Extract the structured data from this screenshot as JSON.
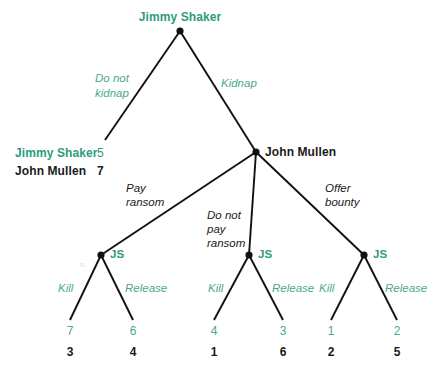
{
  "diagram": {
    "colors": {
      "player1_green": "#2e9b7e",
      "action_green": "#4aa98d",
      "player2_black": "#1a1a1a",
      "edge": "#111111",
      "background": "#ffffff"
    },
    "root": {
      "player_label": "Jimmy Shaker",
      "actions": [
        {
          "label_line1": "Do not",
          "label_line2": "kidnap",
          "style": "green"
        },
        {
          "label_line1": "Kidnap",
          "label_line2": "",
          "style": "green"
        }
      ]
    },
    "terminal_left": {
      "row1_name": "Jimmy Shaker",
      "row1_value": "5",
      "row2_name": "John Mullen",
      "row2_value": "7"
    },
    "second_node": {
      "player_label": "John Mullen",
      "actions": [
        {
          "label_line1": "Pay",
          "label_line2": "ransom",
          "label_line3": "",
          "style": "black"
        },
        {
          "label_line1": "Do not",
          "label_line2": "pay",
          "label_line3": "ransom",
          "style": "black"
        },
        {
          "label_line1": "Offer",
          "label_line2": "bounty",
          "label_line3": "",
          "style": "black"
        }
      ]
    },
    "js_nodes": [
      {
        "label": "JS",
        "left_action": "Kill",
        "right_action": "Release"
      },
      {
        "label": "JS",
        "left_action": "Kill",
        "right_action": "Release"
      },
      {
        "label": "JS",
        "left_action": "Kill",
        "right_action": "Release"
      }
    ],
    "leaves": [
      {
        "top": "7",
        "bottom": "3"
      },
      {
        "top": "6",
        "bottom": "4"
      },
      {
        "top": "4",
        "bottom": "1"
      },
      {
        "top": "3",
        "bottom": "6"
      },
      {
        "top": "1",
        "bottom": "2"
      },
      {
        "top": "2",
        "bottom": "5"
      }
    ]
  }
}
